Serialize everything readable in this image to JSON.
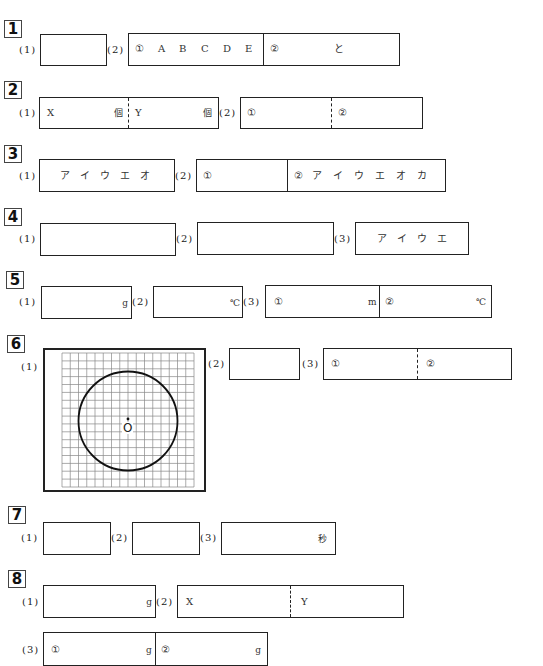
{
  "sections": [
    {
      "number": "1",
      "questions": [
        {
          "label": "(1)"
        },
        {
          "label": "(2)",
          "part1_marker": "①",
          "part1_choices": [
            "A",
            "B",
            "C",
            "D",
            "E"
          ],
          "part2_marker": "②",
          "part2_connector": "と"
        }
      ]
    },
    {
      "number": "2",
      "questions": [
        {
          "label": "(1)",
          "left_prefix": "X",
          "left_unit": "個",
          "right_prefix": "Y",
          "right_unit": "個"
        },
        {
          "label": "(2)",
          "part1_marker": "①",
          "part2_marker": "②"
        }
      ]
    },
    {
      "number": "3",
      "questions": [
        {
          "label": "(1)",
          "choices": [
            "ア",
            "イ",
            "ウ",
            "エ",
            "オ"
          ]
        },
        {
          "label": "(2)",
          "part1_marker": "①",
          "part2_marker": "②",
          "part2_choices": [
            "ア",
            "イ",
            "ウ",
            "エ",
            "オ",
            "カ"
          ]
        }
      ]
    },
    {
      "number": "4",
      "questions": [
        {
          "label": "(1)"
        },
        {
          "label": "(2)"
        },
        {
          "label": "(3)",
          "choices": [
            "ア",
            "イ",
            "ウ",
            "エ"
          ]
        }
      ]
    },
    {
      "number": "5",
      "questions": [
        {
          "label": "(1)",
          "unit": "g"
        },
        {
          "label": "(2)",
          "unit": "℃"
        },
        {
          "label": "(3)",
          "part1_marker": "①",
          "part1_unit": "m",
          "part2_marker": "②",
          "part2_unit": "℃"
        }
      ]
    },
    {
      "number": "6",
      "questions": [
        {
          "label": "(1)",
          "figure": {
            "type": "grid-with-circle",
            "grid_cols": 16,
            "grid_rows": 17,
            "center_label": "O"
          }
        },
        {
          "label": "(2)"
        },
        {
          "label": "(3)",
          "part1_marker": "①",
          "part2_marker": "②"
        }
      ]
    },
    {
      "number": "7",
      "questions": [
        {
          "label": "(1)"
        },
        {
          "label": "(2)"
        },
        {
          "label": "(3)",
          "unit": "秒"
        }
      ]
    },
    {
      "number": "8",
      "questions": [
        {
          "label": "(1)",
          "unit": "g"
        },
        {
          "label": "(2)",
          "left_prefix": "X",
          "right_prefix": "Y"
        },
        {
          "label": "(3)",
          "part1_marker": "①",
          "part1_unit": "g",
          "part2_marker": "②",
          "part2_unit": "g"
        }
      ]
    }
  ]
}
